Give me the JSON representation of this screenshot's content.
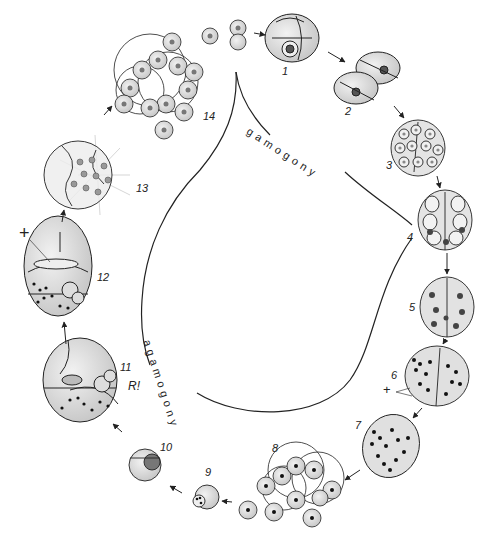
{
  "diagram": {
    "phases": {
      "gamogony": "gamogony",
      "agamogony": "agamogony"
    },
    "stages": [
      {
        "id": "1",
        "label": "1"
      },
      {
        "id": "2",
        "label": "2"
      },
      {
        "id": "3",
        "label": "3"
      },
      {
        "id": "4",
        "label": "4"
      },
      {
        "id": "5",
        "label": "5"
      },
      {
        "id": "6",
        "label": "6"
      },
      {
        "id": "7",
        "label": "7"
      },
      {
        "id": "8",
        "label": "8"
      },
      {
        "id": "9",
        "label": "9"
      },
      {
        "id": "10",
        "label": "10"
      },
      {
        "id": "11",
        "label": "11"
      },
      {
        "id": "12",
        "label": "12"
      },
      {
        "id": "13",
        "label": "13"
      },
      {
        "id": "14",
        "label": "14"
      }
    ],
    "annotations": {
      "meiosis_mark": "R!",
      "plus_mark_12": "+",
      "plus_mark_6": "+"
    },
    "colors": {
      "ink": "#222222",
      "shell_fill": "#dcdcdc",
      "nucleus_fill": "#555555",
      "background": "#ffffff"
    }
  }
}
